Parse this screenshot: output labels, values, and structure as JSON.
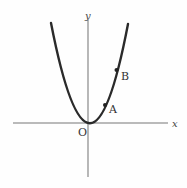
{
  "diagram": {
    "type": "parabola-graph",
    "curve": "y = a x^2 (opening upward, vertex at origin)",
    "axes": {
      "x_label": "x",
      "y_label": "y",
      "origin_label": "O"
    },
    "points": [
      {
        "label": "A",
        "position": "on curve, right branch, lower"
      },
      {
        "label": "B",
        "position": "on curve, right branch, higher"
      }
    ],
    "colors": {
      "curve": "#2a2a2a",
      "axes": "#777777",
      "labels": "#333333"
    }
  }
}
